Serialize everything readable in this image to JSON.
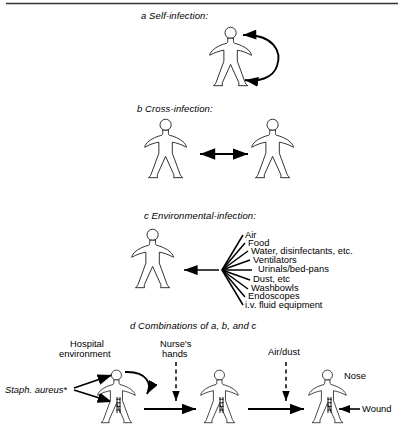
{
  "figure": {
    "title_rule": "top-horizontal-rule",
    "panels": [
      {
        "id": "a",
        "letter": "a",
        "label": "Self-infection:",
        "full_label": "a  Self-infection:",
        "figures_count": 1,
        "arrow_type": "curved-double-headed-self-loop"
      },
      {
        "id": "b",
        "letter": "b",
        "label": "Cross-infection:",
        "full_label": "b  Cross-infection:",
        "figures_count": 2,
        "arrow_type": "horizontal-double-headed"
      },
      {
        "id": "c",
        "letter": "c",
        "label": "Environmental-infection:",
        "full_label": "c  Environmental-infection:",
        "figures_count": 1,
        "arrow_type": "fan-converging-to-single-left-arrow",
        "sources": [
          "Air",
          "Food",
          "Water, disinfectants, etc.",
          "Ventilators",
          "Urinals/bed-pans",
          "Dust, etc",
          "Washbowls",
          "Endoscopes",
          "i.v. fluid equipment"
        ]
      },
      {
        "id": "d",
        "letter": "d",
        "label": "Combinations of a, b, and c",
        "full_label": "d  Combinations of a, b, and c",
        "figures_count": 3,
        "source_label": "Staph. aureus*",
        "annotations": [
          {
            "text": "Hospital",
            "line2": "environment"
          },
          {
            "text": "Nurse's",
            "line2": "hands"
          },
          {
            "text": "Air/dust",
            "line2": ""
          }
        ],
        "body_site_labels": [
          "Nose",
          "Wound"
        ]
      }
    ],
    "colors": {
      "ink": "#000000",
      "background": "#ffffff",
      "rule": "#333333"
    }
  }
}
